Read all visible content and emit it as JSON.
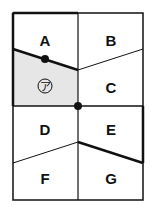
{
  "regions": [
    {
      "id": "A",
      "label": "A",
      "x": 45,
      "y": 40
    },
    {
      "id": "B",
      "label": "B",
      "x": 111,
      "y": 40
    },
    {
      "id": "C",
      "label": "C",
      "x": 111,
      "y": 90
    },
    {
      "id": "D",
      "label": "D",
      "x": 45,
      "y": 130
    },
    {
      "id": "E",
      "label": "E",
      "x": 111,
      "y": 130
    },
    {
      "id": "F",
      "label": "F",
      "x": 45,
      "y": 179
    },
    {
      "id": "G",
      "label": "G",
      "x": 111,
      "y": 179
    }
  ],
  "shaded_region": {
    "label": "ア",
    "fill": "#e6e6e6"
  },
  "colors": {
    "line": "#111111",
    "shade": "#e6e6e6"
  }
}
